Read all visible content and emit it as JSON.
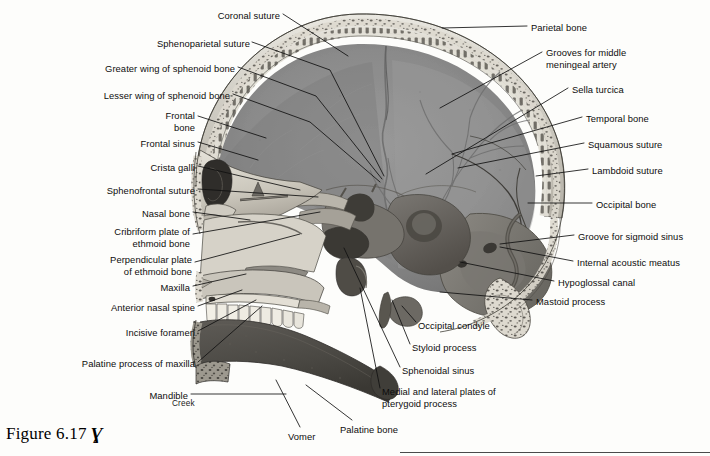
{
  "figure": {
    "caption_text": "Figure 6.17",
    "caption_glyph": "Ɣ",
    "signature": "Creek",
    "background_hex": "#fdfdfb",
    "ink_hex": "#0d0d0d",
    "leader_hex": "#111111"
  },
  "labels_left": [
    {
      "id": "coronal-suture",
      "text": "Coronal suture",
      "x": 170,
      "y": 10,
      "w": 110,
      "align": "right"
    },
    {
      "id": "sphenoparietal-suture",
      "text": "Sphenoparietal suture",
      "x": 95,
      "y": 38,
      "w": 155,
      "align": "right"
    },
    {
      "id": "greater-wing-sphenoid",
      "text": "Greater wing of sphenoid bone",
      "x": 30,
      "y": 63,
      "w": 205,
      "align": "right"
    },
    {
      "id": "lesser-wing-sphenoid",
      "text": "Lesser wing of sphenoid bone",
      "x": 30,
      "y": 90,
      "w": 200,
      "align": "right"
    },
    {
      "id": "frontal-bone",
      "text": "Frontal\nbone",
      "x": 110,
      "y": 110,
      "w": 85,
      "align": "right"
    },
    {
      "id": "frontal-sinus",
      "text": "Frontal sinus",
      "x": 95,
      "y": 138,
      "w": 100,
      "align": "right"
    },
    {
      "id": "crista-galli",
      "text": "Crista galli",
      "x": 100,
      "y": 162,
      "w": 95,
      "align": "right"
    },
    {
      "id": "sphenofrontal-suture",
      "text": "Sphenofrontal suture",
      "x": 58,
      "y": 185,
      "w": 137,
      "align": "right"
    },
    {
      "id": "nasal-bone",
      "text": "Nasal bone",
      "x": 95,
      "y": 208,
      "w": 95,
      "align": "right"
    },
    {
      "id": "cribriform-plate-ethmoid",
      "text": "Cribriform plate of\nethmoid bone",
      "x": 60,
      "y": 226,
      "w": 130,
      "align": "right"
    },
    {
      "id": "perpendicular-plate-ethmoid",
      "text": "Perpendicular plate\nof ethmoid bone",
      "x": 55,
      "y": 254,
      "w": 137,
      "align": "right"
    },
    {
      "id": "maxilla",
      "text": "Maxilla",
      "x": 120,
      "y": 282,
      "w": 70,
      "align": "right"
    },
    {
      "id": "anterior-nasal-spine",
      "text": "Anterior nasal spine",
      "x": 60,
      "y": 302,
      "w": 135,
      "align": "right"
    },
    {
      "id": "incisive-foramen",
      "text": "Incisive foramen",
      "x": 75,
      "y": 327,
      "w": 120,
      "align": "right"
    },
    {
      "id": "palatine-process-maxilla",
      "text": "Palatine process of maxilla",
      "x": 30,
      "y": 358,
      "w": 165,
      "align": "right"
    },
    {
      "id": "mandible",
      "text": "Mandible",
      "x": 110,
      "y": 390,
      "w": 78,
      "align": "right"
    }
  ],
  "labels_right": [
    {
      "id": "parietal-bone",
      "text": "Parietal bone",
      "x": 531,
      "y": 22,
      "align": "left"
    },
    {
      "id": "grooves-middle-meningeal",
      "text": "Grooves for middle\nmeningeal artery",
      "x": 546,
      "y": 47,
      "align": "left"
    },
    {
      "id": "sella-turcica",
      "text": "Sella turcica",
      "x": 572,
      "y": 84,
      "align": "left"
    },
    {
      "id": "temporal-bone",
      "text": "Temporal bone",
      "x": 586,
      "y": 113,
      "align": "left"
    },
    {
      "id": "squamous-suture",
      "text": "Squamous suture",
      "x": 588,
      "y": 139,
      "align": "left"
    },
    {
      "id": "lambdoid-suture",
      "text": "Lambdoid suture",
      "x": 592,
      "y": 165,
      "align": "left"
    },
    {
      "id": "occipital-bone",
      "text": "Occipital bone",
      "x": 596,
      "y": 199,
      "align": "left"
    },
    {
      "id": "groove-sigmoid-sinus",
      "text": "Groove for sigmoid sinus",
      "x": 578,
      "y": 231,
      "align": "left"
    },
    {
      "id": "internal-acoustic-meatus",
      "text": "Internal acoustic meatus",
      "x": 577,
      "y": 257,
      "align": "left"
    },
    {
      "id": "hypoglossal-canal",
      "text": "Hypoglossal canal",
      "x": 558,
      "y": 277,
      "align": "left"
    },
    {
      "id": "mastoid-process",
      "text": "Mastoid process",
      "x": 536,
      "y": 296,
      "align": "left"
    },
    {
      "id": "occipital-condyle",
      "text": "Occipital condyle",
      "x": 418,
      "y": 320,
      "align": "left"
    },
    {
      "id": "styloid-process",
      "text": "Styloid process",
      "x": 412,
      "y": 342,
      "align": "left"
    },
    {
      "id": "sphenoidal-sinus",
      "text": "Sphenoidal sinus",
      "x": 402,
      "y": 365,
      "align": "left"
    },
    {
      "id": "medial-lateral-pterygoid",
      "text": "Medial and lateral plates of\npterygoid process",
      "x": 382,
      "y": 386,
      "align": "left"
    },
    {
      "id": "palatine-bone",
      "text": "Palatine bone",
      "x": 340,
      "y": 424,
      "align": "left"
    },
    {
      "id": "vomer",
      "text": "Vomer",
      "x": 288,
      "y": 431,
      "align": "left"
    }
  ],
  "leaders_left": [
    {
      "id": "coronal-suture",
      "pts": "283,14 348,56"
    },
    {
      "id": "sphenoparietal-suture",
      "pts": "252,42 330,70 384,176"
    },
    {
      "id": "greater-wing-sphenoid",
      "pts": "238,67 316,96 382,179"
    },
    {
      "id": "lesser-wing-sphenoid",
      "pts": "233,94 310,122 380,182"
    },
    {
      "id": "frontal-bone",
      "pts": "198,116 266,138"
    },
    {
      "id": "frontal-sinus",
      "pts": "198,142 258,160"
    },
    {
      "id": "crista-galli",
      "pts": "198,166 300,190"
    },
    {
      "id": "sphenofrontal-suture",
      "pts": "198,189 318,197"
    },
    {
      "id": "nasal-bone",
      "pts": "193,212 250,220"
    },
    {
      "id": "cribriform-plate-ethmoid",
      "pts": "193,234 320,212"
    },
    {
      "id": "perpendicular-plate-ethmoid",
      "pts": "195,262 300,234"
    },
    {
      "id": "maxilla",
      "pts": "193,286 246,274"
    },
    {
      "id": "anterior-nasal-spine",
      "pts": "198,306 242,290"
    },
    {
      "id": "incisive-foramen",
      "pts": "198,331 256,300"
    },
    {
      "id": "palatine-process-maxilla",
      "pts": "198,362 262,306"
    },
    {
      "id": "mandible",
      "pts": "191,394 286,394"
    }
  ],
  "leaders_right": [
    {
      "id": "parietal-bone",
      "pts": "527,26 442,28"
    },
    {
      "id": "grooves-middle-meningeal",
      "pts": "542,52 440,108"
    },
    {
      "id": "sella-turcica",
      "pts": "568,88 426,174"
    },
    {
      "id": "temporal-bone",
      "pts": "582,117 452,154"
    },
    {
      "id": "squamous-suture",
      "pts": "584,143 458,168"
    },
    {
      "id": "lambdoid-suture",
      "pts": "588,169 536,176"
    },
    {
      "id": "occipital-bone",
      "pts": "592,203 528,203"
    },
    {
      "id": "groove-sigmoid-sinus",
      "pts": "574,235 500,244"
    },
    {
      "id": "internal-acoustic-meatus",
      "pts": "573,261 500,247"
    },
    {
      "id": "hypoglossal-canal",
      "pts": "554,281 460,262"
    },
    {
      "id": "mastoid-process",
      "pts": "532,300 440,292"
    },
    {
      "id": "occipital-condyle",
      "pts": "416,322 402,306"
    },
    {
      "id": "styloid-process",
      "pts": "410,344 392,300"
    },
    {
      "id": "sphenoidal-sinus",
      "pts": "400,367 344,248"
    },
    {
      "id": "medial-lateral-pterygoid",
      "pts": "380,388 360,288"
    },
    {
      "id": "palatine-bone",
      "pts": "352,420 306,385"
    },
    {
      "id": "vomer",
      "pts": "300,427 276,380"
    }
  ],
  "rule": {
    "x": 400,
    "y": 452,
    "w": 310
  }
}
